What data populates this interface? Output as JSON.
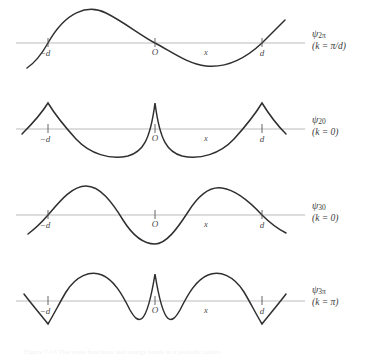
{
  "figure": {
    "axis_color": "#b9b9b9",
    "curve_color": "#2b2b2b",
    "tick_color": "#4a4a4a",
    "background": "#ffffff"
  },
  "ticks": {
    "minus_d": "−d",
    "origin": "O",
    "x": "x",
    "plus_d": "d"
  },
  "caption": {
    "text": "Figure 7-13 The wave functions and energy bands in a periodic lattice."
  },
  "panels": [
    {
      "id": "panel-psi-2pi",
      "label_main": "ψ",
      "label_sub": "2π",
      "label_k": "(k = π/d)",
      "wave_type": "smooth-sine",
      "periods": 1.0,
      "phase": "rising-at-minus-d",
      "amplitude": 30,
      "cusps": false
    },
    {
      "id": "panel-psi-20",
      "label_main": "ψ",
      "label_sub": "20",
      "label_k": "(k = 0)",
      "wave_type": "cusped-peaks",
      "periods": 2.0,
      "phase": "peak-at-nodes",
      "amplitude": 27,
      "cusps": true
    },
    {
      "id": "panel-psi-30",
      "label_main": "ψ",
      "label_sub": "30",
      "label_k": "(k = 0)",
      "wave_type": "smooth-sine",
      "periods": 2.0,
      "phase": "rising-at-minus-d",
      "amplitude": 29,
      "cusps": false
    },
    {
      "id": "panel-psi-3pi",
      "label_main": "ψ",
      "label_sub": "3π",
      "label_k": "(k = π)",
      "wave_type": "cusped-mixed",
      "periods": 3.0,
      "phase": "cusp-down-at-d",
      "amplitude": 28,
      "cusps": true
    }
  ]
}
